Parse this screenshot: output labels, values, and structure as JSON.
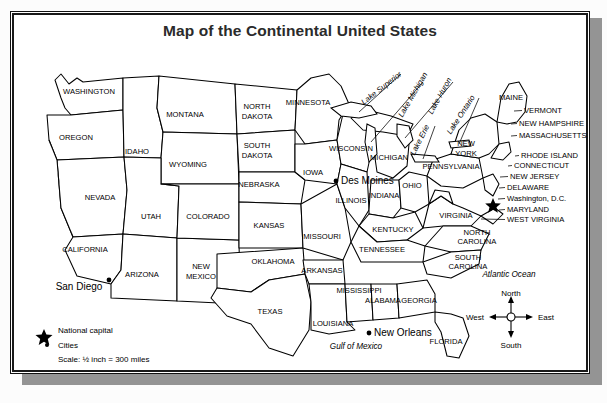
{
  "page": {
    "background_color": "#fcfcfc",
    "shadow_color": "#949494",
    "frame_color": "#1a1a1a",
    "map_fill": "#ffffff"
  },
  "title": "Map of the Continental United States",
  "legend": {
    "capital_icon": "star-icon",
    "capital_label": "National capital",
    "cities_icon": "dot-icon",
    "cities_label": "Cities",
    "scale_label": "Scale: ½ inch = 300 miles"
  },
  "compass": {
    "north": "North",
    "south": "South",
    "east": "East",
    "west": "West"
  },
  "oceans": [
    {
      "name": "Atlantic Ocean",
      "x": 498,
      "y": 265
    },
    {
      "name": "Gulf of Mexico",
      "x": 345,
      "y": 337
    }
  ],
  "lakes": [
    {
      "name": "Lake Superior",
      "x": 372,
      "y": 78,
      "rotate": -38
    },
    {
      "name": "Lake Michigan",
      "x": 404,
      "y": 84,
      "rotate": -60
    },
    {
      "name": "Lake Huron",
      "x": 431,
      "y": 85,
      "rotate": -61
    },
    {
      "name": "Lake Erie",
      "x": 411,
      "y": 129,
      "rotate": -63
    },
    {
      "name": "Lake Ontario",
      "x": 452,
      "y": 104,
      "rotate": -57
    }
  ],
  "cities": [
    {
      "name": "Des Moines",
      "x": 330,
      "y": 172,
      "marker": "dot",
      "anchor": "start"
    },
    {
      "name": "San Diego",
      "x": 68,
      "y": 278,
      "marker": "dot",
      "anchor": "middle"
    },
    {
      "name": "New Orleans",
      "x": 363,
      "y": 324,
      "marker": "dot",
      "anchor": "start"
    }
  ],
  "capital": {
    "name": "Washington, D.C.",
    "marker": "star"
  },
  "states_inline": [
    {
      "name": "WASHINGTON",
      "x": 78,
      "y": 82
    },
    {
      "name": "OREGON",
      "x": 65,
      "y": 128
    },
    {
      "name": "MONTANA",
      "x": 174,
      "y": 105
    },
    {
      "name": "IDAHO",
      "x": 126,
      "y": 142
    },
    {
      "name": "WYOMING",
      "x": 177,
      "y": 155
    },
    {
      "name": "NEVADA",
      "x": 89,
      "y": 188
    },
    {
      "name": "UTAH",
      "x": 140,
      "y": 207
    },
    {
      "name": "COLORADO",
      "x": 197,
      "y": 207
    },
    {
      "name": "CALIFORNIA",
      "x": 74,
      "y": 240
    },
    {
      "name": "ARIZONA",
      "x": 131,
      "y": 265
    },
    {
      "name": "NEW",
      "x": 190,
      "y": 257
    },
    {
      "name": "MEXICO",
      "x": 190,
      "y": 267
    },
    {
      "name": "NORTH",
      "x": 246,
      "y": 97
    },
    {
      "name": "DAKOTA",
      "x": 246,
      "y": 107
    },
    {
      "name": "SOUTH",
      "x": 246,
      "y": 136
    },
    {
      "name": "DAKOTA",
      "x": 246,
      "y": 146
    },
    {
      "name": "NEBRASKA",
      "x": 248,
      "y": 175
    },
    {
      "name": "KANSAS",
      "x": 258,
      "y": 216
    },
    {
      "name": "OKLAHOMA",
      "x": 262,
      "y": 252
    },
    {
      "name": "TEXAS",
      "x": 259,
      "y": 302
    },
    {
      "name": "MINNESOTA",
      "x": 297,
      "y": 93
    },
    {
      "name": "IOWA",
      "x": 302,
      "y": 163
    },
    {
      "name": "MISSOURI",
      "x": 311,
      "y": 227
    },
    {
      "name": "ARKANSAS",
      "x": 311,
      "y": 261
    },
    {
      "name": "LOUISIANA",
      "x": 322,
      "y": 314
    },
    {
      "name": "WISCONSIN",
      "x": 340,
      "y": 139
    },
    {
      "name": "ILLINOIS",
      "x": 340,
      "y": 191
    },
    {
      "name": "MISSISSIPPI",
      "x": 348,
      "y": 281
    },
    {
      "name": "ALABAMA",
      "x": 372,
      "y": 291
    },
    {
      "name": "MICHIGAN",
      "x": 378,
      "y": 148
    },
    {
      "name": "INDIANA",
      "x": 373,
      "y": 186
    },
    {
      "name": "OHIO",
      "x": 401,
      "y": 176
    },
    {
      "name": "KENTUCKY",
      "x": 382,
      "y": 220
    },
    {
      "name": "TENNESSEE",
      "x": 371,
      "y": 240
    },
    {
      "name": "GEORGIA",
      "x": 408,
      "y": 291
    },
    {
      "name": "FLORIDA",
      "x": 435,
      "y": 332
    },
    {
      "name": "PENNSYLVANIA",
      "x": 440,
      "y": 157
    },
    {
      "name": "NEW",
      "x": 455,
      "y": 134
    },
    {
      "name": "YORK",
      "x": 455,
      "y": 144
    },
    {
      "name": "MAINE",
      "x": 500,
      "y": 88
    },
    {
      "name": "VIRGINIA",
      "x": 445,
      "y": 206
    },
    {
      "name": "NORTH",
      "x": 466,
      "y": 223
    },
    {
      "name": "CAROLINA",
      "x": 466,
      "y": 232
    },
    {
      "name": "SOUTH",
      "x": 457,
      "y": 248
    },
    {
      "name": "CAROLINA",
      "x": 457,
      "y": 257
    }
  ],
  "states_leadered": [
    {
      "name": "VERMONT",
      "x": 513,
      "y": 101,
      "lx": 503,
      "ly": 99
    },
    {
      "name": "NEW HAMPSHIRE",
      "x": 508,
      "y": 114,
      "lx": 500,
      "ly": 112
    },
    {
      "name": "MASSACHUSETTS",
      "x": 508,
      "y": 126,
      "lx": 500,
      "ly": 124
    },
    {
      "name": "RHODE ISLAND",
      "x": 510,
      "y": 146,
      "lx": 504,
      "ly": 144
    },
    {
      "name": "CONNECTICUT",
      "x": 503,
      "y": 156,
      "lx": 497,
      "ly": 154
    },
    {
      "name": "NEW JERSEY",
      "x": 499,
      "y": 167,
      "lx": 489,
      "ly": 165
    },
    {
      "name": "DELAWARE",
      "x": 496,
      "y": 178,
      "lx": 488,
      "ly": 176
    },
    {
      "name": "Washington, D.C.",
      "x": 496,
      "y": 189,
      "lx": 487,
      "ly": 187
    },
    {
      "name": "MARYLAND",
      "x": 496,
      "y": 200,
      "lx": 488,
      "ly": 198
    },
    {
      "name": "WEST VIRGINIA",
      "x": 496,
      "y": 210,
      "lx": 470,
      "ly": 207
    }
  ]
}
